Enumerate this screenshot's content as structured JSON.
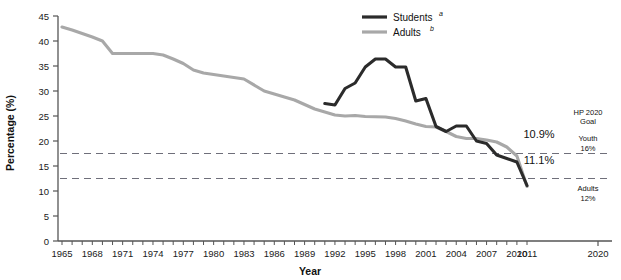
{
  "chart_data": {
    "type": "line",
    "title": "",
    "xlabel": "Year",
    "ylabel": "Percentage (%)",
    "xlim": [
      1965,
      2020
    ],
    "ylim": [
      0,
      45
    ],
    "ytick_step": 5,
    "grid": false,
    "legend_position": "top-center",
    "yticks": [
      "0",
      "5",
      "10",
      "15",
      "20",
      "25",
      "30",
      "35",
      "40",
      "45"
    ],
    "xticks": [
      "1965",
      "1968",
      "1971",
      "1974",
      "1977",
      "1980",
      "1983",
      "1986",
      "1989",
      "1992",
      "1995",
      "1998",
      "2001",
      "2004",
      "2007",
      "2010",
      "2011",
      "2020"
    ],
    "series": [
      {
        "name": "Students",
        "footnote": "a",
        "color": "#2b2b2b",
        "end_label": "11.1%",
        "x": [
          1991,
          1992,
          1993,
          1994,
          1995,
          1996,
          1997,
          1998,
          1999,
          2000,
          2001,
          2002,
          2003,
          2004,
          2005,
          2006,
          2007,
          2008,
          2009,
          2010,
          2011
        ],
        "values": [
          27.5,
          27.2,
          30.5,
          31.6,
          34.8,
          36.4,
          36.4,
          34.8,
          34.8,
          28.0,
          28.5,
          22.9,
          21.9,
          23.0,
          23.0,
          20.0,
          19.5,
          17.2,
          16.5,
          15.8,
          11.1
        ]
      },
      {
        "name": "Adults",
        "footnote": "b",
        "color": "#a8a8a8",
        "end_label": "10.9%",
        "x": [
          1965,
          1966,
          1967,
          1968,
          1969,
          1970,
          1974,
          1975,
          1976,
          1977,
          1978,
          1979,
          1980,
          1983,
          1985,
          1987,
          1988,
          1990,
          1991,
          1992,
          1993,
          1994,
          1995,
          1997,
          1998,
          1999,
          2000,
          2001,
          2002,
          2003,
          2004,
          2005,
          2006,
          2007,
          2008,
          2009,
          2010,
          2011
        ],
        "values": [
          42.8,
          42.2,
          41.5,
          40.8,
          40.0,
          37.5,
          37.5,
          37.2,
          36.4,
          35.5,
          34.2,
          33.6,
          33.3,
          32.4,
          30.0,
          28.8,
          28.2,
          26.4,
          25.8,
          25.2,
          25.0,
          25.1,
          24.9,
          24.8,
          24.5,
          24.0,
          23.4,
          22.9,
          22.8,
          21.9,
          20.9,
          20.5,
          20.5,
          20.2,
          19.8,
          18.8,
          17.0,
          10.9
        ]
      }
    ],
    "reference_lines": [
      {
        "label_group": "HP 2020 Goal",
        "label": "Youth",
        "value_text": "16%",
        "y": 17.5,
        "style": "dashed"
      },
      {
        "label": "Adults",
        "value_text": "12%",
        "y": 12.5,
        "style": "dashed"
      }
    ],
    "annotations": {
      "goal_header_line1": "HP 2020",
      "goal_header_line2": "Goal"
    }
  }
}
